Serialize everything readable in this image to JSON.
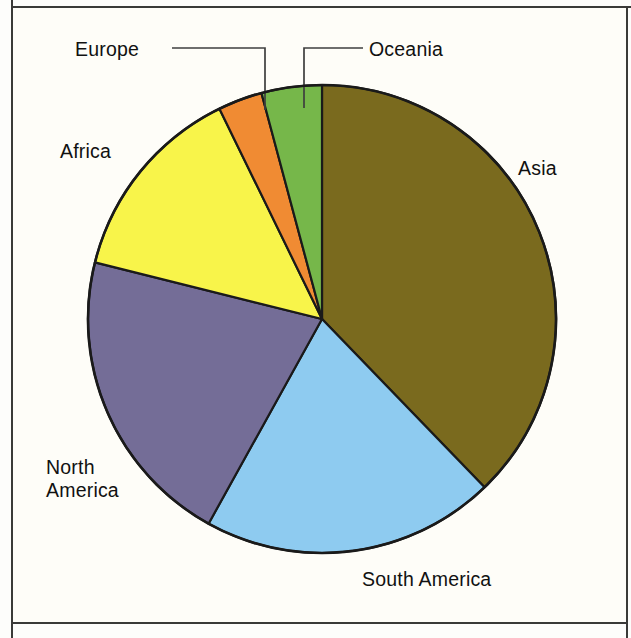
{
  "figure": {
    "background_color": "#fefdf8",
    "frame_color": "#3a3a38",
    "outline_color": "#1a1a1a",
    "leader_color": "#3f3f3f"
  },
  "labels": {
    "europe": "Europe",
    "oceania": "Oceania",
    "africa": "Africa",
    "asia": "Asia",
    "north_america_line1": "North",
    "north_america_line2": "America",
    "south_america": "South America"
  },
  "chart_data": {
    "type": "pie",
    "title": "",
    "subtitle": "",
    "xlabel": "",
    "ylabel": "",
    "grid": false,
    "legend_position": "callout-labels",
    "start_angle_deg": 0,
    "direction": "clockwise",
    "center": {
      "x": 322,
      "y": 319
    },
    "radius": 234,
    "categories": [
      "Asia",
      "South America",
      "North America",
      "Africa",
      "Europe",
      "Oceania"
    ],
    "values": [
      37.8,
      20.3,
      20.8,
      13.9,
      3.1,
      4.2
    ],
    "units": "percent",
    "colors": [
      "#7a6a1e",
      "#8ecbf0",
      "#746d97",
      "#f8f44a",
      "#f08b33",
      "#76b74a"
    ],
    "slices": [
      {
        "label": "Asia",
        "value": 37.8,
        "start_deg": 0,
        "end_deg": 136,
        "color": "#7a6a1e",
        "label_placement": "outside-right"
      },
      {
        "label": "South America",
        "value": 20.3,
        "start_deg": 136,
        "end_deg": 209,
        "color": "#8ecbf0",
        "label_placement": "outside-bottom"
      },
      {
        "label": "North America",
        "value": 20.8,
        "start_deg": 209,
        "end_deg": 284,
        "color": "#746d97",
        "label_placement": "outside-left"
      },
      {
        "label": "Africa",
        "value": 13.9,
        "start_deg": 284,
        "end_deg": 334,
        "color": "#f8f44a",
        "label_placement": "outside-left"
      },
      {
        "label": "Europe",
        "value": 3.1,
        "start_deg": 334,
        "end_deg": 345,
        "color": "#f08b33",
        "label_placement": "leader-line-top-left"
      },
      {
        "label": "Oceania",
        "value": 4.2,
        "start_deg": 345,
        "end_deg": 360,
        "color": "#76b74a",
        "label_placement": "leader-line-top-right"
      }
    ]
  }
}
